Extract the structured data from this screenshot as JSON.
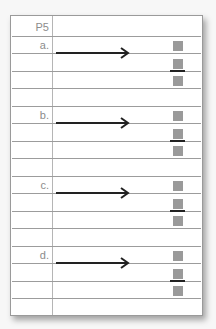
{
  "worksheet": {
    "header": "P5",
    "problems": [
      {
        "label": "a."
      },
      {
        "label": "b."
      },
      {
        "label": "c."
      },
      {
        "label": "d."
      }
    ],
    "colors": {
      "line": "#9c9c9c",
      "box": "#9a9a9a",
      "arrow": "#222222"
    }
  }
}
